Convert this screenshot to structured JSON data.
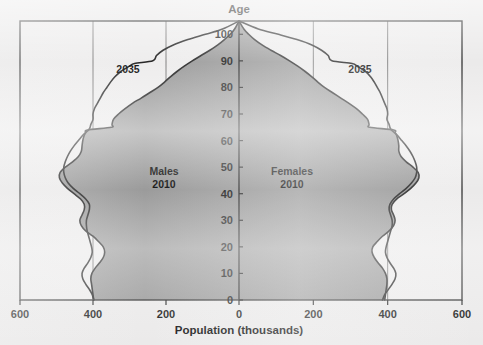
{
  "chart_data": {
    "type": "area",
    "title": "",
    "xlabel": "Population (thousands)",
    "ylabel": "Age",
    "grid": true,
    "legend_position": "inline-annotations",
    "xlim": [
      -600,
      600
    ],
    "ylim": [
      0,
      105
    ],
    "x_tick_labels": [
      "600",
      "400",
      "200",
      "0",
      "200",
      "400",
      "600"
    ],
    "x_tick_values": [
      -600,
      -400,
      -200,
      0,
      200,
      400,
      600
    ],
    "y_tick_labels": [
      "0",
      "10",
      "20",
      "30",
      "40",
      "50",
      "60",
      "70",
      "80",
      "90",
      "100"
    ],
    "y_tick_values": [
      0,
      10,
      20,
      30,
      40,
      50,
      60,
      70,
      80,
      90,
      100
    ],
    "gridline_x_values": [
      -400,
      -200,
      200,
      400
    ],
    "annotations": [
      {
        "text": "2035",
        "side": "left",
        "x": -330,
        "y": 92
      },
      {
        "text": "2035",
        "side": "right",
        "x": 330,
        "y": 92
      },
      {
        "text": "Males",
        "side": "left",
        "x": -185,
        "y": 52
      },
      {
        "text": "2010",
        "side": "left",
        "x": -185,
        "y": 46
      },
      {
        "text": "Females",
        "side": "right",
        "x": 150,
        "y": 52
      },
      {
        "text": "2010",
        "side": "right",
        "x": 150,
        "y": 46
      }
    ],
    "series": [
      {
        "name": "Males 2010",
        "side": "left",
        "fill": true,
        "ages": [
          0,
          2,
          4,
          6,
          8,
          10,
          12,
          14,
          16,
          18,
          20,
          22,
          24,
          26,
          28,
          30,
          32,
          34,
          36,
          38,
          40,
          42,
          44,
          46,
          48,
          50,
          52,
          54,
          56,
          58,
          60,
          62,
          63,
          64,
          65,
          66,
          68,
          70,
          72,
          74,
          76,
          78,
          80,
          82,
          84,
          86,
          88,
          90,
          92,
          94,
          96,
          98,
          100,
          102,
          105
        ],
        "values": [
          398,
          400,
          402,
          404,
          406,
          403,
          394,
          382,
          372,
          368,
          372,
          385,
          400,
          420,
          432,
          436,
          430,
          424,
          424,
          434,
          452,
          470,
          484,
          492,
          490,
          476,
          456,
          440,
          432,
          430,
          428,
          424,
          420,
          415,
          350,
          348,
          344,
          330,
          312,
          292,
          268,
          245,
          222,
          204,
          188,
          170,
          150,
          128,
          104,
          80,
          58,
          40,
          24,
          12,
          0
        ]
      },
      {
        "name": "Males 2035",
        "side": "left",
        "fill": false,
        "ages": [
          0,
          2,
          4,
          6,
          8,
          10,
          12,
          14,
          16,
          18,
          20,
          22,
          24,
          26,
          28,
          30,
          32,
          34,
          36,
          38,
          40,
          42,
          44,
          46,
          48,
          50,
          52,
          54,
          56,
          58,
          60,
          62,
          63,
          64,
          65,
          66,
          68,
          70,
          72,
          74,
          76,
          78,
          80,
          82,
          84,
          86,
          88,
          89,
          90,
          92,
          94,
          96,
          98,
          100,
          102,
          105
        ],
        "values": [
          398,
          402,
          410,
          420,
          428,
          430,
          424,
          414,
          406,
          402,
          404,
          408,
          412,
          416,
          418,
          418,
          414,
          410,
          410,
          420,
          436,
          454,
          468,
          476,
          480,
          480,
          476,
          470,
          462,
          452,
          440,
          428,
          420,
          412,
          408,
          406,
          400,
          400,
          396,
          388,
          380,
          372,
          362,
          352,
          340,
          324,
          300,
          286,
          236,
          226,
          208,
          180,
          140,
          92,
          45,
          0
        ]
      },
      {
        "name": "Females 2010",
        "side": "right",
        "fill": true,
        "ages": [
          0,
          2,
          4,
          6,
          8,
          10,
          12,
          14,
          16,
          18,
          20,
          22,
          24,
          26,
          28,
          30,
          32,
          34,
          36,
          38,
          40,
          42,
          44,
          46,
          48,
          50,
          52,
          54,
          56,
          58,
          60,
          62,
          63,
          64,
          65,
          66,
          68,
          70,
          72,
          74,
          76,
          78,
          80,
          82,
          84,
          86,
          88,
          90,
          92,
          94,
          96,
          98,
          100,
          102,
          105
        ],
        "values": [
          392,
          394,
          396,
          398,
          398,
          394,
          386,
          374,
          364,
          358,
          360,
          372,
          386,
          404,
          416,
          420,
          416,
          410,
          412,
          424,
          444,
          462,
          476,
          484,
          482,
          468,
          450,
          436,
          430,
          430,
          428,
          424,
          420,
          416,
          352,
          350,
          346,
          332,
          316,
          296,
          274,
          252,
          230,
          212,
          196,
          178,
          158,
          136,
          112,
          86,
          62,
          42,
          26,
          13,
          0
        ]
      },
      {
        "name": "Females 2035",
        "side": "right",
        "fill": false,
        "ages": [
          0,
          2,
          4,
          6,
          8,
          10,
          12,
          14,
          16,
          18,
          20,
          22,
          24,
          26,
          28,
          30,
          32,
          34,
          36,
          38,
          40,
          42,
          44,
          46,
          48,
          50,
          52,
          54,
          56,
          58,
          60,
          62,
          63,
          64,
          65,
          66,
          68,
          70,
          72,
          74,
          76,
          78,
          80,
          82,
          84,
          86,
          88,
          89,
          90,
          92,
          94,
          96,
          98,
          100,
          102,
          105
        ],
        "values": [
          386,
          392,
          402,
          412,
          420,
          422,
          416,
          406,
          398,
          394,
          396,
          400,
          404,
          408,
          412,
          412,
          408,
          404,
          406,
          416,
          432,
          450,
          464,
          474,
          478,
          478,
          474,
          468,
          460,
          450,
          438,
          426,
          418,
          410,
          406,
          404,
          398,
          400,
          398,
          392,
          386,
          380,
          372,
          364,
          354,
          340,
          318,
          304,
          250,
          240,
          222,
          196,
          156,
          106,
          52,
          0
        ]
      }
    ]
  },
  "colors": {
    "fill_gray": "#9b9b9b",
    "line_dark": "#262626",
    "frame": "#3a3a3a",
    "gridline": "#6d6d6d",
    "background": "#ebeaea",
    "text": "#141414"
  },
  "labels": {
    "y_axis_title": "Age",
    "x_axis_title": "Population (thousands)",
    "males_name": "Males",
    "males_year": "2010",
    "females_name": "Females",
    "females_year": "2010",
    "projection_left": "2035",
    "projection_right": "2035"
  },
  "x_ticks": {
    "t0": "600",
    "t1": "400",
    "t2": "200",
    "t3": "0",
    "t4": "200",
    "t5": "400",
    "t6": "600"
  },
  "y_ticks": {
    "t0": "0",
    "t1": "10",
    "t2": "20",
    "t3": "30",
    "t4": "40",
    "t5": "50",
    "t6": "60",
    "t7": "70",
    "t8": "80",
    "t9": "90",
    "t10": "100"
  }
}
